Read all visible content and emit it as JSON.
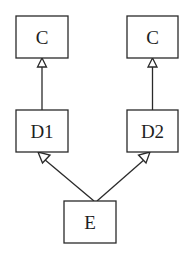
{
  "diagram": {
    "type": "uml-inheritance",
    "nodes": [
      {
        "id": "c_left",
        "label": "C",
        "x": 16,
        "y": 16,
        "w": 52,
        "h": 42
      },
      {
        "id": "c_right",
        "label": "C",
        "x": 127,
        "y": 16,
        "w": 51,
        "h": 42
      },
      {
        "id": "d1",
        "label": "D1",
        "x": 16,
        "y": 110,
        "w": 52,
        "h": 42
      },
      {
        "id": "d2",
        "label": "D2",
        "x": 127,
        "y": 110,
        "w": 51,
        "h": 42
      },
      {
        "id": "e",
        "label": "E",
        "x": 64,
        "y": 201,
        "w": 52,
        "h": 42
      }
    ],
    "edges": [
      {
        "from": "d1",
        "to": "c_left",
        "arrow": "hollow-triangle"
      },
      {
        "from": "d2",
        "to": "c_right",
        "arrow": "hollow-triangle"
      },
      {
        "from": "e",
        "to": "d1",
        "arrow": "hollow-triangle"
      },
      {
        "from": "e",
        "to": "d2",
        "arrow": "hollow-triangle"
      }
    ],
    "colors": {
      "stroke": "#2a2a2a",
      "fill": "#ffffff",
      "text": "#1e1e1e"
    }
  }
}
